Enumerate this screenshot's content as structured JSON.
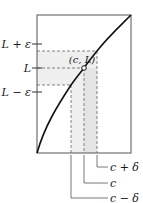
{
  "diagram": {
    "point_label": "(c, L)",
    "y_labels": {
      "upper": "L + ε",
      "middle": "L",
      "lower": "L − ε"
    },
    "x_labels": {
      "right": "c + δ",
      "middle": "c",
      "left": "c − δ"
    },
    "colors": {
      "frame": "#555555",
      "curve": "#111111",
      "dash": "#666666",
      "band_fill": "#ececec",
      "overlap_fill": "#dedede",
      "text": "#1a1a1a"
    }
  }
}
